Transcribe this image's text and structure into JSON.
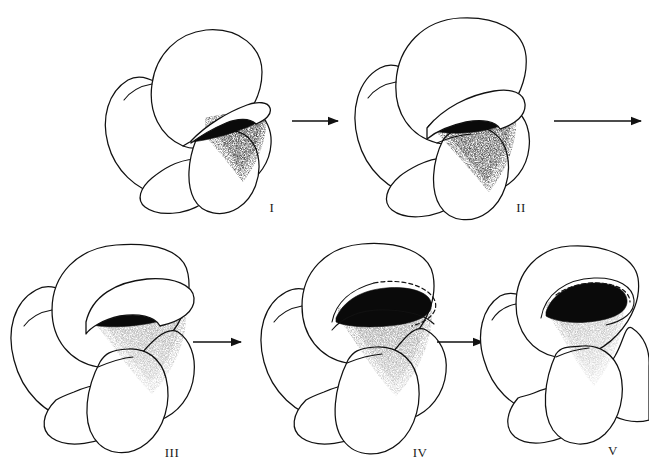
{
  "figure": {
    "type": "scientific-line-drawing",
    "background_color": "#ffffff",
    "ink_color": "#111111",
    "width": 649,
    "height": 470,
    "rows": 2,
    "stage_count": 5
  },
  "stages": [
    {
      "id": "stage-1",
      "label": "I",
      "row": 1,
      "label_x": 272,
      "label_y": 212,
      "center_x": 200,
      "center_y": 110,
      "aperture": "narrow oblique slit with thin raised rim",
      "aperture_shading": "dense stipple fan below aperture",
      "lip_style": "solid thin crescent"
    },
    {
      "id": "stage-2",
      "label": "II",
      "row": 1,
      "label_x": 521,
      "label_y": 212,
      "center_x": 450,
      "center_y": 110,
      "aperture": "broadened oblique opening with thickened rim",
      "aperture_shading": "dark blocky fill with stipple fan",
      "lip_style": "solid crescent, wider"
    },
    {
      "id": "stage-3",
      "label": "III",
      "row": 2,
      "label_x": 172,
      "label_y": 457,
      "center_x": 105,
      "center_y": 340,
      "aperture": "broad arched opening with prominent raised lip",
      "aperture_shading": "dense black band with stipple skirt",
      "lip_style": "solid raised collar"
    },
    {
      "id": "stage-4",
      "label": "IV",
      "row": 2,
      "label_x": 420,
      "label_y": 457,
      "center_x": 350,
      "center_y": 340,
      "aperture": "low arched opening, lip partly dashed",
      "aperture_shading": "black band with broad stipple skirt",
      "lip_style": "partly dashed / stippled outline"
    },
    {
      "id": "stage-5",
      "label": "V",
      "row": 2,
      "label_x": 613,
      "label_y": 455,
      "center_x": 560,
      "center_y": 340,
      "aperture": "compact arched opening enclosed by dashed lip",
      "aperture_shading": "solid black with narrow stipple fan",
      "lip_style": "dashed arc over solid rim",
      "clipped_right_edge": true
    }
  ],
  "arrows": [
    {
      "id": "arrow-1",
      "from": "I",
      "to": "II",
      "x1": 292,
      "y1": 121,
      "x2": 344,
      "y2": 121,
      "direction": "right"
    },
    {
      "id": "arrow-2",
      "from": "II",
      "to": "III",
      "x1": 554,
      "y1": 121,
      "x2": 645,
      "y2": 121,
      "direction": "right"
    },
    {
      "id": "arrow-3",
      "from": "III",
      "to": "IV",
      "x1": 193,
      "y1": 342,
      "x2": 245,
      "y2": 342,
      "direction": "right"
    },
    {
      "id": "arrow-4",
      "from": "IV",
      "to": "V",
      "x1": 437,
      "y1": 342,
      "x2": 487,
      "y2": 342,
      "direction": "right"
    }
  ]
}
